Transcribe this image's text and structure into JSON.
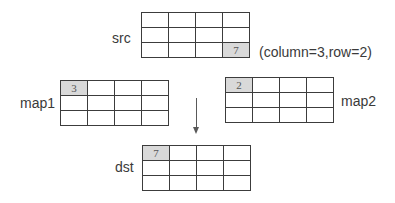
{
  "diagram": {
    "title": "",
    "colors": {
      "grid_line": "#3c3c3c",
      "highlight_fill": "#d9d9d9",
      "arrow": "#595959",
      "text": "#3a3a3a"
    },
    "src": {
      "label": "src",
      "rows": 3,
      "cols": 4,
      "highlight": {
        "row": 2,
        "col": 3,
        "value": "7"
      },
      "annotation": "(column=3,row=2)"
    },
    "map1": {
      "label": "map1",
      "rows": 3,
      "cols": 4,
      "highlight": {
        "row": 0,
        "col": 0,
        "value": "3"
      }
    },
    "map2": {
      "label": "map2",
      "rows": 3,
      "cols": 4,
      "highlight": {
        "row": 0,
        "col": 0,
        "value": "2"
      }
    },
    "dst": {
      "label": "dst",
      "rows": 3,
      "cols": 4,
      "highlight": {
        "row": 0,
        "col": 0,
        "value": "7"
      }
    },
    "arrow": {
      "direction": "down",
      "from": "maps",
      "to": "dst"
    }
  }
}
